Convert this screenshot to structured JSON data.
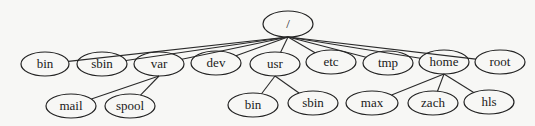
{
  "diagram": {
    "type": "tree",
    "title": "",
    "root": "root",
    "nodes": [
      {
        "id": "root",
        "label": "/",
        "x": 288,
        "y": 24,
        "rx": 25,
        "ry": 13
      },
      {
        "id": "bin",
        "label": "bin",
        "x": 45,
        "y": 64,
        "rx": 24,
        "ry": 12
      },
      {
        "id": "sbin",
        "label": "sbin",
        "x": 102,
        "y": 64,
        "rx": 25,
        "ry": 12
      },
      {
        "id": "var",
        "label": "var",
        "x": 159,
        "y": 64,
        "rx": 25,
        "ry": 12
      },
      {
        "id": "dev",
        "label": "dev",
        "x": 216,
        "y": 63,
        "rx": 25,
        "ry": 12
      },
      {
        "id": "usr",
        "label": "usr",
        "x": 275,
        "y": 64,
        "rx": 25,
        "ry": 12
      },
      {
        "id": "etc",
        "label": "etc",
        "x": 331,
        "y": 62,
        "rx": 25,
        "ry": 12
      },
      {
        "id": "tmp",
        "label": "tmp",
        "x": 388,
        "y": 63,
        "rx": 25,
        "ry": 12
      },
      {
        "id": "home",
        "label": "home",
        "x": 444,
        "y": 62,
        "rx": 25,
        "ry": 12
      },
      {
        "id": "rootdir",
        "label": "root",
        "x": 500,
        "y": 62,
        "rx": 25,
        "ry": 12
      },
      {
        "id": "mail",
        "label": "mail",
        "x": 71,
        "y": 106,
        "rx": 25,
        "ry": 12
      },
      {
        "id": "spool",
        "label": "spool",
        "x": 130,
        "y": 106,
        "rx": 25,
        "ry": 12
      },
      {
        "id": "usr_bin",
        "label": "bin",
        "x": 253,
        "y": 105,
        "rx": 25,
        "ry": 12
      },
      {
        "id": "usr_sbin",
        "label": "sbin",
        "x": 313,
        "y": 103,
        "rx": 25,
        "ry": 12
      },
      {
        "id": "max",
        "label": "max",
        "x": 372,
        "y": 103,
        "rx": 26,
        "ry": 12
      },
      {
        "id": "zach",
        "label": "zach",
        "x": 433,
        "y": 103,
        "rx": 25,
        "ry": 12
      },
      {
        "id": "hls",
        "label": "hls",
        "x": 489,
        "y": 102,
        "rx": 25,
        "ry": 12
      }
    ],
    "edges": [
      {
        "from": "root",
        "to": "bin"
      },
      {
        "from": "root",
        "to": "sbin"
      },
      {
        "from": "root",
        "to": "var"
      },
      {
        "from": "root",
        "to": "dev"
      },
      {
        "from": "root",
        "to": "usr"
      },
      {
        "from": "root",
        "to": "etc"
      },
      {
        "from": "root",
        "to": "tmp"
      },
      {
        "from": "root",
        "to": "home"
      },
      {
        "from": "root",
        "to": "rootdir"
      },
      {
        "from": "var",
        "to": "mail"
      },
      {
        "from": "var",
        "to": "spool"
      },
      {
        "from": "usr",
        "to": "usr_bin"
      },
      {
        "from": "usr",
        "to": "usr_sbin"
      },
      {
        "from": "home",
        "to": "max"
      },
      {
        "from": "home",
        "to": "zach"
      },
      {
        "from": "home",
        "to": "hls"
      }
    ],
    "colors": {
      "background": "#f7f7f5",
      "stroke": "#222222",
      "text": "#1a1a1a"
    }
  }
}
